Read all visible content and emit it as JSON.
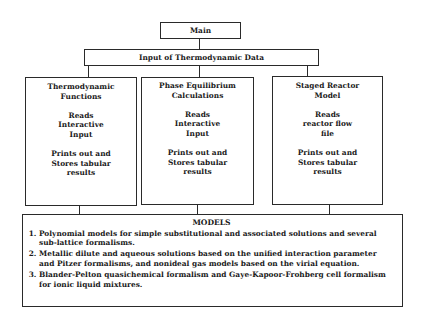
{
  "main": {
    "label": "Main"
  },
  "input": {
    "label": "Input of Thermodynamic Data"
  },
  "modules": [
    {
      "title": [
        "Thermodynamic",
        "Functions"
      ],
      "reads": [
        "Reads",
        "Interactive",
        "Input"
      ],
      "output": [
        "Prints out and",
        "Stores tabular",
        "results"
      ]
    },
    {
      "title": [
        "Phase Equilibrium",
        "Calculations"
      ],
      "reads": [
        "Reads",
        "Interactive",
        "Input"
      ],
      "output": [
        "Prints out and",
        "Stores tabular",
        "results"
      ]
    },
    {
      "title": [
        "Staged Reactor",
        "Model"
      ],
      "reads": [
        "Reads",
        "reactor flow",
        "file"
      ],
      "output": [
        "Prints out and",
        "Stores tabular",
        "results"
      ]
    }
  ],
  "models": {
    "title": "MODELS",
    "items": [
      "Polynomial models for simple substitutional and associated solutions and several sub-lattice formalisms.",
      "Metallic dilute and aqueous solutions based on the unified interaction parameter and Pitzer formalisms, and nonideal gas models based on the virial equation.",
      "Blander-Pelton quasichemical formalism and Gaye-Kapoor-Frohberg cell formalism for ionic liquid mixtures."
    ]
  }
}
